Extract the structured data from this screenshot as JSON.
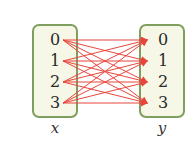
{
  "diagram": {
    "type": "mapping",
    "sets": [
      {
        "name": "x",
        "elements": [
          "0",
          "1",
          "2",
          "3"
        ]
      },
      {
        "name": "y",
        "elements": [
          "0",
          "1",
          "2",
          "3"
        ]
      }
    ],
    "edges": [
      [
        "0",
        "0"
      ],
      [
        "0",
        "1"
      ],
      [
        "0",
        "2"
      ],
      [
        "0",
        "3"
      ],
      [
        "1",
        "0"
      ],
      [
        "1",
        "1"
      ],
      [
        "1",
        "2"
      ],
      [
        "1",
        "3"
      ],
      [
        "2",
        "0"
      ],
      [
        "2",
        "1"
      ],
      [
        "2",
        "2"
      ],
      [
        "2",
        "3"
      ],
      [
        "3",
        "0"
      ],
      [
        "3",
        "1"
      ],
      [
        "3",
        "2"
      ],
      [
        "3",
        "3"
      ]
    ],
    "colors": {
      "box_border": "#7f9f5f",
      "box_fill": "#f6f7e6",
      "arrow": "#e8453c"
    }
  },
  "labels": {
    "x": "x",
    "y": "y"
  },
  "x_elements": [
    "0",
    "1",
    "2",
    "3"
  ],
  "y_elements": [
    "0",
    "1",
    "2",
    "3"
  ]
}
